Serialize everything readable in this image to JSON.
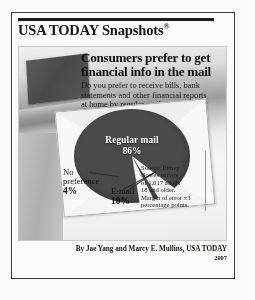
{
  "masthead": {
    "title": "USA TODAY Snapshots",
    "registered_mark": "®"
  },
  "headline": {
    "line1": "Consumers prefer to get",
    "line2": "financial info in the mail"
  },
  "deck": {
    "line1": "Do you prefer to receive bills, bank",
    "line2": "statements and other financial reports",
    "line3": "at home by regular mail or by e-mail?"
  },
  "source": {
    "line1": "Source: Pitney",
    "line2": "Bowes survey",
    "line3": "of 1,017 adults",
    "line4": "18 and older.",
    "line5": "Margin of error ±3",
    "line6": "percentage points."
  },
  "credit": {
    "byline": "By Jae Yang and Marcy E. Mullins, USA TODAY",
    "year": "2007"
  },
  "labels": {
    "regular_mail_name": "Regular mail",
    "regular_mail_value": "86%",
    "no_preference_name": "No preference",
    "no_preference_name_l1": "No",
    "no_preference_name_l2": "preference",
    "no_preference_value": "4%",
    "email_name": "E-mail",
    "email_value": "10%"
  },
  "colors": {
    "pie_major": "#4a4a49",
    "pie_minor": "#f4f4f2",
    "panel_bg": "#e9e9e7",
    "frame_border": "#3a3a3a",
    "text": "#101014"
  },
  "chart_data": {
    "type": "pie",
    "title": "Consumers prefer to get financial info in the mail",
    "subtitle": "Do you prefer to receive bills, bank statements and other financial reports at home by regular mail or by e-mail?",
    "categories": [
      "Regular mail",
      "E-mail",
      "No preference"
    ],
    "values": [
      86,
      10,
      4
    ],
    "unit": "percent",
    "labels": [
      "86%",
      "10%",
      "4%"
    ],
    "colors": [
      "#4a4a49",
      "#f4f4f2",
      "#f4f4f2"
    ],
    "legend": "none",
    "grid": false,
    "annotations": [
      "Source: Pitney Bowes survey of 1,017 adults 18 and older. Margin of error ±3 percentage points.",
      "By Jae Yang and Marcy E. Mullins, USA TODAY",
      "2007"
    ]
  }
}
